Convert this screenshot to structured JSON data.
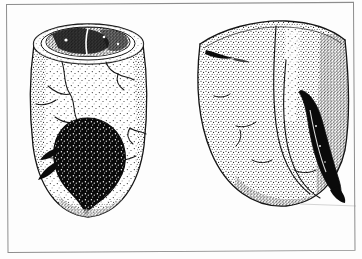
{
  "plate": {
    "name": "archaeological-artifact-plate",
    "medium": "pen-and-ink stipple line drawing",
    "background_color": "#fdfdfd",
    "ink_color": "#111111",
    "frame_color": "#8d8d8d",
    "frame": {
      "visible": true,
      "style": "thin single rule rectangle",
      "inset_left_px": 6,
      "inset_top_px": 4,
      "width_px": 348,
      "height_px": 249,
      "slight_rotation_deg": -0.35
    },
    "figure_count": 2,
    "figures": [
      {
        "id": "left-artifact",
        "label": "",
        "name": "vessel-with-open-rim",
        "description": "Cylindrical thick-walled vessel shown in three-quarter view with open circular mouth at top, stippled exterior, radiating crack lines, and a large dark teardrop-shaped residue or inclusion on the lower body",
        "view": "three-quarter from above",
        "bounds": {
          "x": 18,
          "y": 14,
          "width": 142,
          "height": 208
        },
        "features": [
          {
            "name": "rim-ellipse",
            "type": "opening",
            "fill": "white",
            "outline": "double line"
          },
          {
            "name": "interior-fill",
            "type": "dark-stipple-mass",
            "fill": "dark",
            "location": "inside mouth"
          },
          {
            "name": "body-stipple",
            "type": "shading",
            "density": "light-to-medium"
          },
          {
            "name": "crack-lines",
            "type": "fracture",
            "count": 7
          },
          {
            "name": "dark-teardrop-inclusion",
            "type": "solid-black-mass",
            "location": "lower body center",
            "speckled": true
          },
          {
            "name": "rounded-base",
            "type": "contour"
          }
        ]
      },
      {
        "id": "right-artifact",
        "label": "",
        "name": "curved-vessel-fragment",
        "description": "Curved wall fragment or sherd, broadly rectangular at top and tapering to a rounded curved tip at lower right, heavily stippled, with an elongated dark crescent inclusion along the right edge and a small dark linear mark at upper left",
        "view": "exterior surface, curved profile",
        "bounds": {
          "x": 192,
          "y": 14,
          "width": 158,
          "height": 208
        },
        "features": [
          {
            "name": "upper-edge-contour",
            "type": "contour"
          },
          {
            "name": "body-stipple",
            "type": "shading",
            "density": "medium"
          },
          {
            "name": "vertical-ridge-line",
            "type": "contour",
            "location": "center"
          },
          {
            "name": "small-dark-mark",
            "type": "solid-black-mark",
            "location": "upper left"
          },
          {
            "name": "dark-crescent-inclusion",
            "type": "solid-black-mass",
            "location": "right edge, vertical elongated"
          },
          {
            "name": "curved-tip",
            "type": "contour",
            "location": "bottom right"
          },
          {
            "name": "crack-lines",
            "type": "fracture",
            "count": 4
          }
        ]
      }
    ]
  }
}
